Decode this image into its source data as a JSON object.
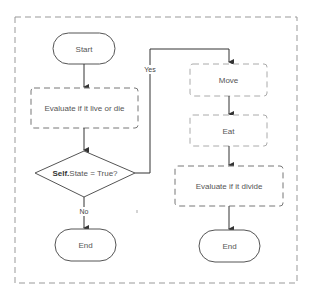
{
  "diagram": {
    "type": "flowchart",
    "colors": {
      "stroke": "#555555",
      "dashed_stroke": "#888888",
      "container_stroke": "#999999",
      "light_dashed_stroke": "#aaaaaa",
      "text": "#555555"
    },
    "nodes": {
      "start": {
        "label": "Start",
        "shape": "terminal"
      },
      "evaluate_live": {
        "label": "Evaluate if it live or die",
        "shape": "process-dashed"
      },
      "decision": {
        "label_bold": "Self.",
        "label_rest": "State = True?",
        "shape": "decision"
      },
      "end_left": {
        "label": "End",
        "shape": "terminal"
      },
      "move": {
        "label": "Move",
        "shape": "process-dashed-light"
      },
      "eat": {
        "label": "Eat",
        "shape": "process-dashed-light"
      },
      "evaluate_divide": {
        "label": "Evaluate if it divide",
        "shape": "process-dashed"
      },
      "end_right": {
        "label": "End",
        "shape": "terminal"
      }
    },
    "edges": {
      "yes_label": "Yes",
      "no_label": "No"
    }
  }
}
